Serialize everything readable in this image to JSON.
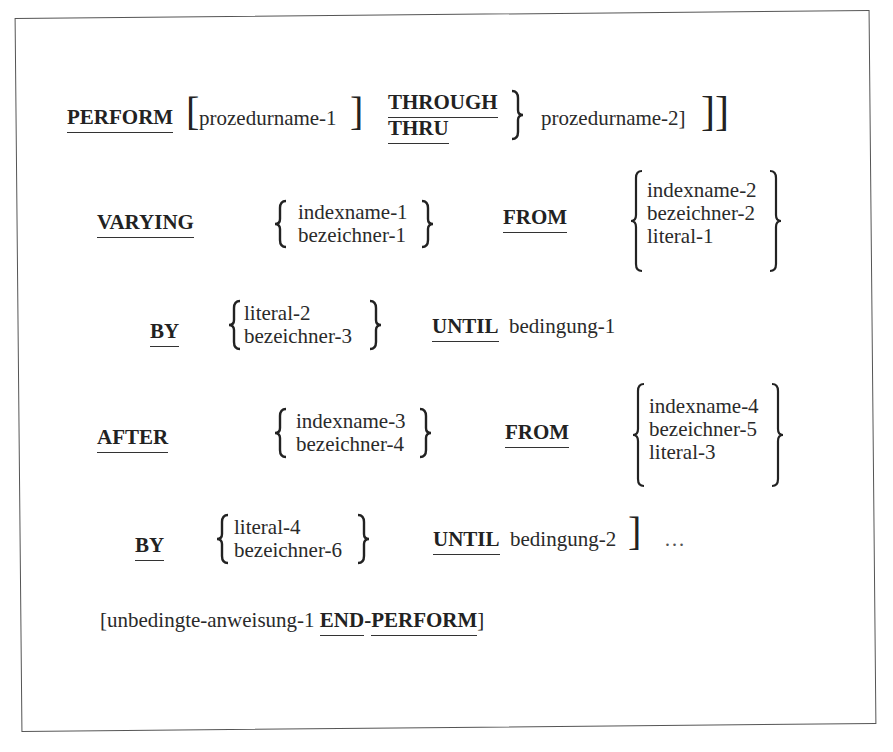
{
  "syntax": {
    "line1": {
      "keyword": "PERFORM",
      "proc1": "prozedurname-1",
      "alt_through": "THROUGH",
      "alt_thru": "THRU",
      "proc2": "prozedurname-2]"
    },
    "varying": {
      "keyword": "VARYING",
      "choices": [
        "indexname-1",
        "bezeichner-1"
      ],
      "from_keyword": "FROM",
      "from_choices": [
        "indexname-2",
        "bezeichner-2",
        "literal-1"
      ]
    },
    "by1": {
      "keyword": "BY",
      "choices": [
        "literal-2",
        "bezeichner-3"
      ],
      "until_keyword": "UNTIL",
      "condition": "bedingung-1"
    },
    "after": {
      "keyword": "AFTER",
      "choices": [
        "indexname-3",
        "bezeichner-4"
      ],
      "from_keyword": "FROM",
      "from_choices": [
        "indexname-4",
        "bezeichner-5",
        "literal-3"
      ]
    },
    "by2": {
      "keyword": "BY",
      "choices": [
        "literal-4",
        "bezeichner-6"
      ],
      "until_keyword": "UNTIL",
      "condition": "bedingung-2",
      "ellipsis": "…"
    },
    "last": {
      "statement": "[unbedingte-anweisung-1",
      "end_keyword": "END",
      "hyphen": "-",
      "perform_keyword": "PERFORM",
      "close": "]"
    }
  }
}
